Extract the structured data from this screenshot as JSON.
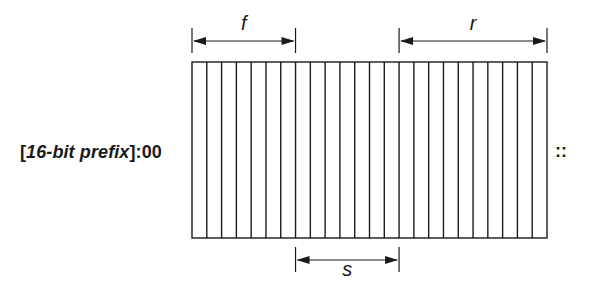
{
  "diagram": {
    "title": "",
    "prefix_label": {
      "open_bracket": "[",
      "italic_text": "16-bit prefix",
      "close_suffix": "]:00"
    },
    "trailing_label": "::",
    "field_count_cells": 24,
    "dimensions": [
      {
        "name": "f",
        "label": "f",
        "position": "top",
        "start_cell": 0,
        "end_cell": 7
      },
      {
        "name": "r",
        "label": "r",
        "position": "top",
        "start_cell": 14,
        "end_cell": 24
      },
      {
        "name": "s",
        "label": "s",
        "position": "bottom",
        "start_cell": 7,
        "end_cell": 14
      }
    ],
    "colors": {
      "stroke": "#1a1a1a",
      "background": "#ffffff"
    }
  }
}
